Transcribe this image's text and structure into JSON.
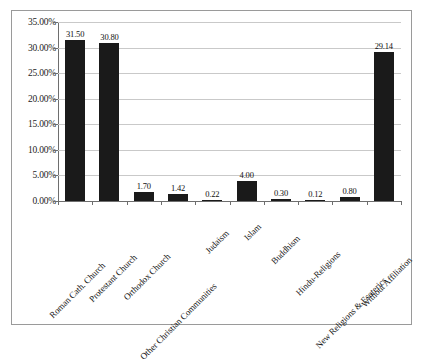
{
  "chart_data": {
    "type": "bar",
    "title": "",
    "subtitle": "",
    "xlabel": "",
    "ylabel": "",
    "categories": [
      "Roman Cath. Church",
      "Protestant Church",
      "Orthodox Church",
      "Other Christian Communities",
      "Judaism",
      "Islam",
      "Buddhism",
      "Hindu-Religions",
      "New Religions & Esoterics",
      "Without Affiliation"
    ],
    "values": [
      31.5,
      30.8,
      1.7,
      1.42,
      0.22,
      4.0,
      0.3,
      0.12,
      0.8,
      29.14
    ],
    "data_labels": [
      "31.50",
      "30.80",
      "1.70",
      "1.42",
      "0.22",
      "4.00",
      "0.30",
      "0.12",
      "0.80",
      "29.14"
    ],
    "ylim": [
      0,
      35
    ],
    "ytick_values": [
      0,
      5,
      10,
      15,
      20,
      25,
      30,
      35
    ],
    "ytick_labels": [
      "0.00%",
      "5.00%",
      "10.00%",
      "15.00%",
      "20.00%",
      "25.00%",
      "30.00%",
      "35.00%"
    ],
    "grid": true,
    "legend": null,
    "legend_position": "none",
    "bar_color": "#1a1a1a",
    "gridline_color": "#c9c9c9",
    "axis_color": "#6e6e6e",
    "background_color": "#ffffff",
    "border_color": "#9a9a9a"
  }
}
